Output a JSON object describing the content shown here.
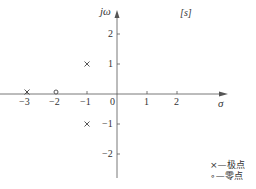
{
  "diagram": {
    "plane_label": "[s]",
    "x_axis_label": "σ",
    "y_axis_label": "jω",
    "x_ticks": [
      "−3",
      "−2",
      "−1",
      "0",
      "1",
      "2"
    ],
    "y_ticks_pos": [
      "2",
      "1"
    ],
    "y_ticks_neg": [
      "−1",
      "−2"
    ],
    "poles": [
      {
        "re": -3,
        "im": 0
      },
      {
        "re": -1,
        "im": 1
      },
      {
        "re": -1,
        "im": -1
      }
    ],
    "zeros": [
      {
        "re": -2,
        "im": 0
      }
    ],
    "legend": {
      "pole": "×—极点",
      "zero": "∘—零点"
    }
  }
}
